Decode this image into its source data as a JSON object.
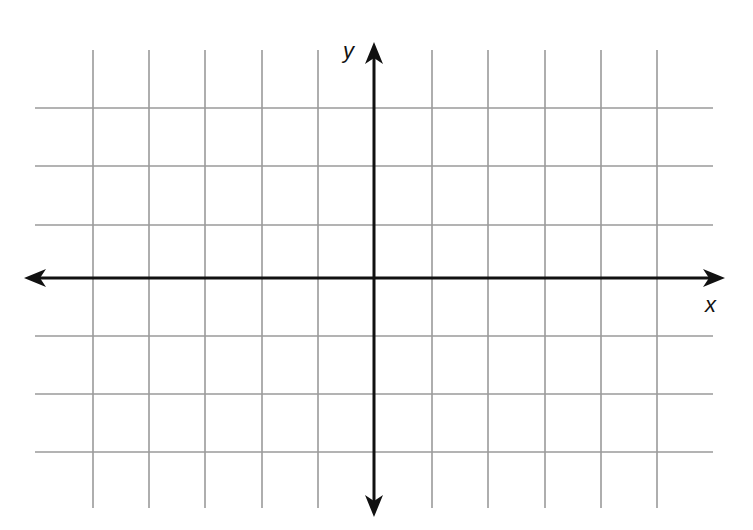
{
  "diagram": {
    "type": "coordinate-plane",
    "x_axis_label": "x",
    "y_axis_label": "y",
    "grid": {
      "vertical_lines_x": [
        93,
        149,
        205,
        262,
        318,
        432,
        488,
        545,
        601,
        657
      ],
      "horizontal_lines_y": [
        108,
        166,
        225,
        336,
        394,
        452
      ],
      "vertical_extent": [
        50,
        508
      ],
      "horizontal_extent": [
        35,
        713
      ],
      "columns_left_of_y_axis": 5,
      "columns_right_of_y_axis": 5,
      "rows_above_x_axis": 3,
      "rows_below_x_axis": 3
    },
    "axes": {
      "origin": [
        374,
        278
      ],
      "x_axis_extent": [
        24,
        725
      ],
      "y_axis_extent": [
        42,
        517
      ],
      "arrows": [
        "left",
        "right",
        "up",
        "down"
      ]
    },
    "colors": {
      "background": "#ffffff",
      "grid_line": "#9a9a9a",
      "axis": "#111111",
      "label": "#111111"
    }
  }
}
